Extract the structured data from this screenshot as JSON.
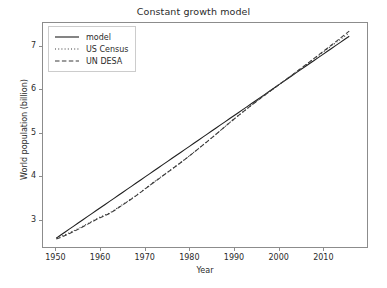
{
  "chart_data": {
    "type": "line",
    "title": "Constant growth model",
    "xlabel": "Year",
    "ylabel": "World population (billion)",
    "xlim": [
      1947,
      2020
    ],
    "ylim": [
      2.35,
      7.55
    ],
    "grid": false,
    "legend_position": "upper left",
    "xticks": [
      1950,
      1960,
      1970,
      1980,
      1990,
      2000,
      2010
    ],
    "yticks": [
      3,
      4,
      5,
      6,
      7
    ],
    "x": [
      1950,
      1951,
      1952,
      1953,
      1954,
      1955,
      1956,
      1957,
      1958,
      1959,
      1960,
      1961,
      1962,
      1963,
      1964,
      1965,
      1966,
      1967,
      1968,
      1969,
      1970,
      1971,
      1972,
      1973,
      1974,
      1975,
      1976,
      1977,
      1978,
      1979,
      1980,
      1981,
      1982,
      1983,
      1984,
      1985,
      1986,
      1987,
      1988,
      1989,
      1990,
      1991,
      1992,
      1993,
      1994,
      1995,
      1996,
      1997,
      1998,
      1999,
      2000,
      2001,
      2002,
      2003,
      2004,
      2005,
      2006,
      2007,
      2008,
      2009,
      2010,
      2011,
      2012,
      2013,
      2014,
      2015,
      2016
    ],
    "series": [
      {
        "name": "model",
        "linestyle": "solid",
        "color": "#1f1f1f",
        "values": [
          2.557,
          2.628,
          2.699,
          2.77,
          2.841,
          2.912,
          2.983,
          3.054,
          3.125,
          3.196,
          3.267,
          3.338,
          3.409,
          3.48,
          3.551,
          3.622,
          3.693,
          3.764,
          3.835,
          3.906,
          3.977,
          4.048,
          4.119,
          4.19,
          4.261,
          4.332,
          4.403,
          4.474,
          4.545,
          4.616,
          4.687,
          4.758,
          4.829,
          4.9,
          4.971,
          5.042,
          5.113,
          5.184,
          5.255,
          5.326,
          5.397,
          5.468,
          5.539,
          5.61,
          5.681,
          5.752,
          5.823,
          5.894,
          5.965,
          6.036,
          6.107,
          6.178,
          6.249,
          6.32,
          6.391,
          6.462,
          6.533,
          6.604,
          6.675,
          6.746,
          6.817,
          6.888,
          6.959,
          7.03,
          7.101,
          7.172,
          7.243
        ]
      },
      {
        "name": "US Census",
        "linestyle": "dotted",
        "color": "#3a3a3a",
        "values": [
          2.557,
          2.594,
          2.636,
          2.682,
          2.73,
          2.781,
          2.834,
          2.89,
          2.947,
          3.001,
          3.05,
          3.094,
          3.141,
          3.202,
          3.272,
          3.34,
          3.408,
          3.477,
          3.549,
          3.626,
          3.703,
          3.78,
          3.858,
          3.933,
          4.008,
          4.083,
          4.158,
          4.233,
          4.309,
          4.388,
          4.468,
          4.55,
          4.634,
          4.717,
          4.8,
          4.884,
          4.969,
          5.057,
          5.145,
          5.232,
          5.316,
          5.399,
          5.482,
          5.563,
          5.643,
          5.722,
          5.8,
          5.878,
          5.954,
          6.03,
          6.105,
          6.18,
          6.255,
          6.33,
          6.406,
          6.482,
          6.559,
          6.636,
          6.713,
          6.79,
          6.866,
          6.942,
          7.018,
          7.094,
          7.17,
          7.245,
          7.32
        ]
      },
      {
        "name": "UN DESA",
        "linestyle": "dashed",
        "color": "#3a3a3a",
        "values": [
          2.536,
          2.573,
          2.618,
          2.665,
          2.714,
          2.765,
          2.819,
          2.875,
          2.932,
          2.986,
          3.035,
          3.08,
          3.128,
          3.191,
          3.261,
          3.33,
          3.399,
          3.469,
          3.542,
          3.619,
          3.696,
          3.774,
          3.852,
          3.927,
          4.003,
          4.079,
          4.154,
          4.23,
          4.306,
          4.385,
          4.465,
          4.547,
          4.631,
          4.715,
          4.798,
          4.882,
          4.968,
          5.056,
          5.144,
          5.231,
          5.316,
          5.399,
          5.482,
          5.563,
          5.643,
          5.721,
          5.799,
          5.877,
          5.954,
          6.03,
          6.106,
          6.182,
          6.257,
          6.333,
          6.41,
          6.487,
          6.565,
          6.643,
          6.722,
          6.801,
          6.88,
          6.959,
          7.039,
          7.119,
          7.199,
          7.28,
          7.36
        ]
      }
    ]
  },
  "legend": {
    "items": [
      {
        "label": "model"
      },
      {
        "label": "US Census"
      },
      {
        "label": "UN DESA"
      }
    ]
  }
}
